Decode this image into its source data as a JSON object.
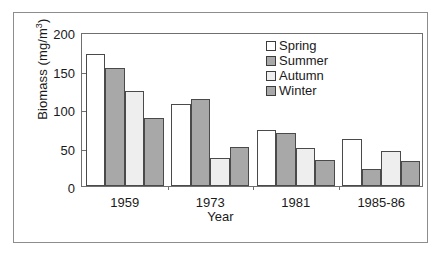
{
  "chart_data": {
    "type": "bar",
    "title": "",
    "subtitle": "",
    "xlabel": "Year",
    "ylabel": "Biomass (mg/m",
    "ylabel_sup": "3",
    "ylabel_tail": ")",
    "ylabel_full": "Biomass (mg/m3)",
    "categories": [
      "1959",
      "1973",
      "1981",
      "1985-86"
    ],
    "series": [
      {
        "name": "Spring",
        "color": "#ffffff",
        "values": [
          172,
          107,
          73,
          61
        ]
      },
      {
        "name": "Summer",
        "color": "#a8a8a8",
        "values": [
          153,
          113,
          69,
          22
        ]
      },
      {
        "name": "Autumn",
        "color": "#eeeeee",
        "values": [
          123,
          37,
          49,
          46
        ]
      },
      {
        "name": "Winter",
        "color": "#a8a8a8",
        "values": [
          88,
          51,
          34,
          33
        ]
      }
    ],
    "ylim": [
      0,
      200
    ],
    "yticks": [
      0,
      50,
      100,
      150,
      200
    ],
    "ytick_labels": [
      "0",
      "50",
      "100",
      "150",
      "200"
    ],
    "grid": false,
    "legend_position": "top-right",
    "bar_edge_color": "#4a4a4a",
    "axis_color": "#6f6f6f",
    "frame_color": "#8d8d8d"
  },
  "legend": {
    "entries": [
      {
        "label": "Spring"
      },
      {
        "label": "Summer"
      },
      {
        "label": "Autumn"
      },
      {
        "label": "Winter"
      }
    ]
  }
}
